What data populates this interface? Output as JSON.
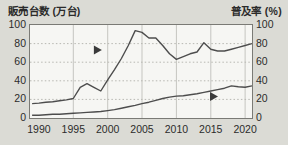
{
  "chart_data": {
    "type": "line",
    "title_left": "販売台数 (万台)",
    "title_right": "普及率 (%)",
    "x_range": [
      1988.7,
      2021
    ],
    "y_range": [
      0,
      100
    ],
    "grid_years": [
      1995,
      2000,
      2005,
      2010,
      2015,
      2020
    ],
    "x_tick_years": [
      1990,
      1995,
      2000,
      2005,
      2010,
      2015,
      2020
    ],
    "x_tick_labels": [
      "1990",
      "1995",
      "2000",
      "2005",
      "2010",
      "2015",
      "2020"
    ],
    "y_ticks_left": [
      0,
      20,
      40,
      60,
      80,
      100
    ],
    "y_ticks_right": [
      0,
      20,
      40,
      60,
      80,
      100
    ],
    "years": [
      1989,
      1990,
      1991,
      1992,
      1993,
      1994,
      1995,
      1996,
      1997,
      1998,
      1999,
      2000,
      2001,
      2002,
      2003,
      2004,
      2005,
      2006,
      2007,
      2008,
      2009,
      2010,
      2011,
      2012,
      2013,
      2014,
      2015,
      2016,
      2017,
      2018,
      2019,
      2020,
      2021
    ],
    "series": [
      {
        "name": "販売台数",
        "axis": "left",
        "values": [
          15.5,
          16,
          17,
          17.5,
          18.5,
          19.5,
          21,
          33,
          37,
          33,
          29,
          41,
          52,
          64,
          78,
          94,
          92,
          86,
          86,
          78,
          69,
          63,
          66,
          69,
          71,
          81,
          74,
          72,
          72,
          74,
          76,
          78,
          80
        ]
      },
      {
        "name": "普及率",
        "axis": "right",
        "values": [
          3,
          3,
          3.5,
          4,
          4,
          4.5,
          5,
          5.5,
          6,
          6.5,
          7,
          8,
          9,
          10.5,
          12,
          13.5,
          15.5,
          17,
          19,
          21,
          22.5,
          23.5,
          24,
          25,
          26,
          27.5,
          29,
          30.5,
          32,
          34.5,
          33.5,
          33,
          34.5
        ]
      }
    ],
    "annotations": [
      {
        "type": "arrow-right",
        "series": "販売台数",
        "year": 1998.5,
        "value": 73
      },
      {
        "type": "arrow-right",
        "series": "普及率",
        "year": 2015.4,
        "value": 23
      }
    ],
    "colors": {
      "background": "#dbdbd5",
      "plot_bg": "#f6f6f3",
      "border": "#7a7a75",
      "grid_v": "#c5c5c0",
      "grid_h": "#b8b8b2",
      "line": "#4d4d4d",
      "arrow": "#3a3a3a",
      "text": "#2b2b2b"
    }
  }
}
